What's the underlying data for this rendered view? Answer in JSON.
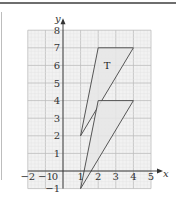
{
  "chart_data": {
    "type": "diagram-grid",
    "title": "",
    "xlabel": "x",
    "ylabel": "y",
    "xlim": [
      -2,
      5
    ],
    "ylim": [
      -1,
      8
    ],
    "x_ticks": [
      "-2",
      "-1",
      "1",
      "2",
      "3",
      "4",
      "5"
    ],
    "y_ticks": [
      "-1",
      "1",
      "2",
      "3",
      "4",
      "5",
      "6",
      "7",
      "8"
    ],
    "origin_label": "0",
    "grid": true,
    "shapes": [
      {
        "name": "T",
        "label": "T",
        "vertices": [
          [
            1,
            2
          ],
          [
            2,
            7
          ],
          [
            4,
            7
          ]
        ],
        "fill": "#e6e6e6"
      },
      {
        "name": "image",
        "label": "",
        "vertices": [
          [
            1,
            -1
          ],
          [
            2,
            4
          ],
          [
            4,
            4
          ]
        ],
        "fill": "#e6e6e6"
      }
    ]
  },
  "colors": {
    "grid_minor": "#e2e2e2",
    "grid_major": "#bcbcbc",
    "grid_bg": "#f2f2f2",
    "axis": "#333333",
    "shape_stroke": "#444444"
  }
}
